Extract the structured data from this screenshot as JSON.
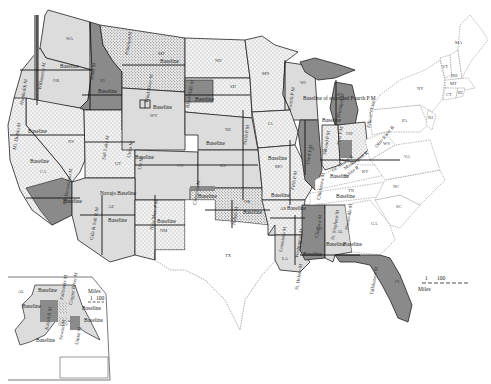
{
  "map": {
    "title": "Principal meridians and baselines of the United States Public Land Survey",
    "colors": {
      "background": "#ffffff",
      "light_fill": "#dcdcdc",
      "dark_fill": "#8a8a8a",
      "stipple_base": "#f2f2f2",
      "stipple_dot": "#6a6a6a",
      "boundary": "#222222",
      "state_line": "#777777"
    },
    "states": {
      "WA": "WA",
      "OR": "OR",
      "ID": "ID",
      "MT": "MT",
      "ND": "ND",
      "SD": "SD",
      "MN": "MN",
      "WI": "WI",
      "MI": "MI",
      "WY": "WY",
      "NE": "NE",
      "IA": "IA",
      "NV": "NV",
      "CA": "CA",
      "UT": "UT",
      "CO": "CO",
      "KS": "KS",
      "MO": "MO",
      "IL": "IL",
      "IN": "IN",
      "OH": "OH",
      "AZ": "AZ",
      "NM": "NM",
      "OK": "OK",
      "AR": "AR",
      "TN": "TN",
      "KY": "KY",
      "TX": "TX",
      "LA": "LA",
      "MS": "MS",
      "AL": "AL",
      "GA": "GA",
      "FL": "FL",
      "SC": "SC",
      "NC": "NC",
      "VA": "VA",
      "WV": "WV",
      "PA": "PA",
      "NY": "NY",
      "VT": "VT",
      "NH": "NH",
      "MA_ME": "MA",
      "MA": "MT",
      "CT": "CT",
      "RI": "RI",
      "NJ": "NJ",
      "AK": "AL"
    },
    "meridians": {
      "willamette": "Willamette M",
      "humboldt": "Humboldt M",
      "mt_diablo": "Mt. Diablo M",
      "san_bernardino": "San Bernardino M",
      "boise": "Boise M",
      "principal_mt": "Principal M",
      "wind_river": "Wind River M",
      "black_hills": "Black Hills M",
      "salt_lake": "Salt Lake M",
      "uinta": "Uinta M",
      "ute": "Ute M",
      "navajo": "Navajo",
      "gila_salt": "Gila & Salt R M",
      "new_mexico": "New Mex. P M",
      "sixth_pm": "Sixth P M",
      "cimarron": "Cimarron M",
      "indian": "Indian M",
      "fifth_pm": "Fifth P M",
      "fourth_pm": "Fourth P M",
      "third_pm": "Third P M",
      "second_pm": "Second P M",
      "first_pm": "First P M",
      "michigan": "Michigan M",
      "louisiana": "Louisiana M",
      "washington": "Washington M",
      "st_helena": "St. Helena M",
      "choctaw": "Choctaw M",
      "chickasaw": "Chickasaw M",
      "st_stephens": "St. Stephens M",
      "huntsville": "Huntsville M",
      "tallahassee": "Tallahassee M",
      "ohio_river": "Ohio River B",
      "muskingum": "Muskingum R",
      "scioto": "Scioto R",
      "great_miami": "Gt. Miami R",
      "ellicotts": "Ellicott's Line",
      "copper_river": "Copper River M",
      "fairbanks": "Fairbanks M",
      "kateel": "Kateel R M",
      "seward": "Seward M",
      "umiat": "Umiat M"
    },
    "labels": {
      "baseline": "Baseline",
      "extended_fourth": "Baseline of extended Fourth P M",
      "navajo_baseline": "Navajo Baseline"
    },
    "scale": {
      "main": {
        "start": "1",
        "end": "100",
        "unit": "Miles"
      },
      "inset": {
        "start": "1",
        "end": "100",
        "unit": "Miles"
      }
    },
    "inset": {
      "label": "AL"
    }
  }
}
